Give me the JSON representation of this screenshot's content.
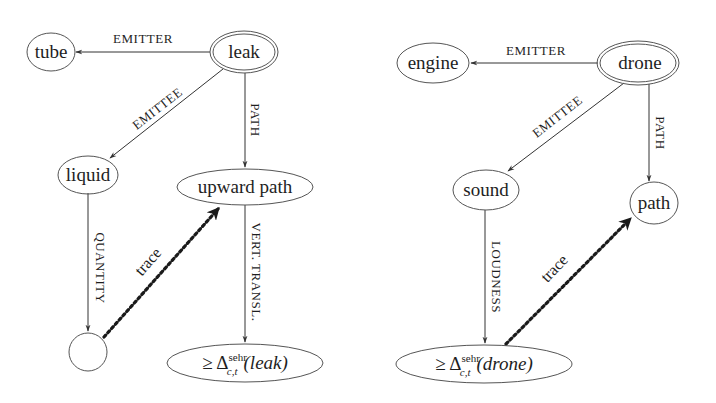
{
  "diagrams": [
    {
      "name": "leak-graph",
      "nodes": {
        "root": "leak",
        "emitter": "tube",
        "emittee": "liquid",
        "path": "upward path",
        "quantity": "",
        "result_prefix": "≥ Δ",
        "result_sup": "sehr",
        "result_sub": "c,t",
        "result_arg": "(leak)"
      },
      "edges": {
        "emitter": "EMITTER",
        "emittee": "EMITTEE",
        "path": "PATH",
        "quantity": "QUANTITY",
        "vert": "VERT. TRANSL.",
        "trace": "trace"
      }
    },
    {
      "name": "drone-graph",
      "nodes": {
        "root": "drone",
        "emitter": "engine",
        "emittee": "sound",
        "path": "path",
        "result_prefix": "≥ Δ",
        "result_sup": "sehr",
        "result_sub": "c,t",
        "result_arg": "(drone)"
      },
      "edges": {
        "emitter": "EMITTER",
        "emittee": "EMITTEE",
        "path": "PATH",
        "loudness": "LOUDNESS",
        "trace": "trace"
      }
    }
  ],
  "colors": {
    "stroke": "#555555",
    "text": "#1e1e1e",
    "background": "#ffffff"
  }
}
